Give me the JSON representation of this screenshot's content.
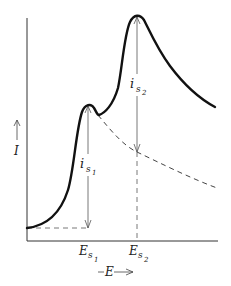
{
  "diagram": {
    "type": "voltammogram-sketch",
    "axes": {
      "y_label": "I",
      "x_label": "E",
      "x_arrow": "—E—>"
    },
    "peaks": [
      {
        "current_label_main": "i",
        "current_label_sub": "s",
        "current_label_subsub": "1",
        "potential_label_main": "E",
        "potential_label_sub": "s",
        "potential_label_subsub": "1"
      },
      {
        "current_label_main": "i",
        "current_label_sub": "s",
        "current_label_subsub": "2",
        "potential_label_main": "E",
        "potential_label_sub": "s",
        "potential_label_subsub": "2"
      }
    ],
    "colors": {
      "curve": "#111111",
      "axes": "#333333",
      "dashed": "#444444",
      "arrows": "#555555"
    }
  }
}
